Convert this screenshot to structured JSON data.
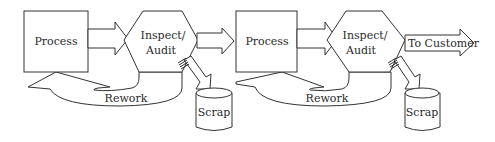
{
  "diagram": {
    "type": "process-flow",
    "stages": [
      {
        "process": {
          "label": "Process"
        },
        "inspect": {
          "label_line1": "Inspect/",
          "label_line2": "Audit"
        },
        "rework": {
          "label": "Rework"
        },
        "scrap": {
          "label": "Scrap"
        }
      },
      {
        "process": {
          "label": "Process"
        },
        "inspect": {
          "label_line1": "Inspect/",
          "label_line2": "Audit"
        },
        "rework": {
          "label": "Rework"
        },
        "scrap": {
          "label": "Scrap"
        }
      }
    ],
    "output": {
      "label": "To Customer"
    },
    "colors": {
      "stroke": "#333333",
      "fill": "#ffffff",
      "text": "#2a2a2a"
    }
  }
}
